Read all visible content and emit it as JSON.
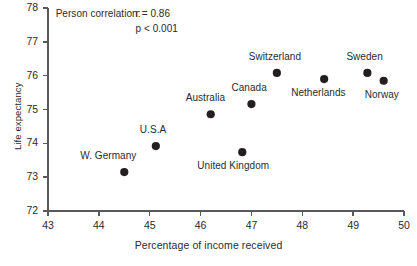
{
  "chart_data": {
    "type": "scatter",
    "title": "",
    "xlabel": "Percentage of income received",
    "ylabel": "Life expectancy",
    "xlim": [
      43,
      50
    ],
    "ylim": [
      72,
      78
    ],
    "xticks": [
      "43",
      "44",
      "45",
      "46",
      "47",
      "48",
      "49",
      "50"
    ],
    "yticks": [
      "72",
      "73",
      "74",
      "75",
      "76",
      "77",
      "78"
    ],
    "grid": false,
    "legend": "none",
    "marker_color": "#231f20",
    "axis_color": "#58595b",
    "points": [
      {
        "label": "W. Germany",
        "x": 44.5,
        "y": 73.15,
        "label_dx": -44,
        "label_dy": -15
      },
      {
        "label": "U.S.A",
        "x": 45.12,
        "y": 73.92,
        "label_dx": -16,
        "label_dy": -15
      },
      {
        "label": "Australia",
        "x": 46.2,
        "y": 74.86,
        "label_dx": -25,
        "label_dy": -15
      },
      {
        "label": "United Kingdom",
        "x": 46.82,
        "y": 73.74,
        "label_dx": -45,
        "label_dy": 15
      },
      {
        "label": "Canada",
        "x": 47.0,
        "y": 75.16,
        "label_dx": -20,
        "label_dy": -15
      },
      {
        "label": "Switzerland",
        "x": 47.5,
        "y": 76.08,
        "label_dx": -28,
        "label_dy": -15
      },
      {
        "label": "Netherlands",
        "x": 48.43,
        "y": 75.9,
        "label_dx": -33,
        "label_dy": 15
      },
      {
        "label": "Sweden",
        "x": 49.28,
        "y": 76.08,
        "label_dx": -21,
        "label_dy": -15
      },
      {
        "label": "Norway",
        "x": 49.6,
        "y": 75.85,
        "label_dx": -19,
        "label_dy": 15
      }
    ],
    "annotations": [
      {
        "text": "Person correlation:",
        "x": 43.15,
        "y": 77.78
      },
      {
        "text": "r = 0.86",
        "x": 44.72,
        "y": 77.78
      },
      {
        "text": "p < 0.001",
        "x": 44.72,
        "y": 77.34
      }
    ],
    "statistics": {
      "correlation_label": "Person correlation:",
      "r_value": "r = 0.86",
      "p_value": "p < 0.001"
    }
  }
}
